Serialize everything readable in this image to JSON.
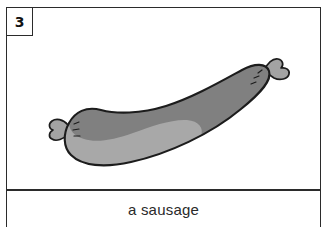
{
  "card": {
    "number": "3",
    "caption": "a sausage",
    "border_color": "#2b2b2b",
    "background_color": "#ffffff"
  },
  "illustration": {
    "subject": "sausage",
    "icon_name": "sausage-drawing",
    "style": "hand-drawn line art with flat gray shading",
    "outline_color": "#1c1c1c",
    "shade_dark_color": "#808080",
    "shade_light_color": "#a8a8a8",
    "orientation": "curved crescent rising from lower-left to upper-right",
    "parts": [
      "left twisted casing tie",
      "right twisted casing tie",
      "dark upper shading band",
      "light lower body",
      "hatch marks near left tie",
      "hatch marks near right tie"
    ]
  }
}
